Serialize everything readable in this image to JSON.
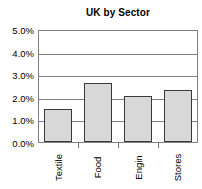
{
  "chart_data": {
    "type": "bar",
    "title": "UK by Sector",
    "xlabel": "",
    "ylabel": "",
    "categories": [
      "Textile",
      "Food",
      "Engin",
      "Stores"
    ],
    "values": [
      1.45,
      2.6,
      2.05,
      2.3
    ],
    "value_unit": "%",
    "ylim": [
      0,
      5
    ],
    "y_tick_values": [
      5.0,
      4.0,
      3.0,
      2.0,
      1.0,
      0.0
    ],
    "y_tick_labels": [
      "5.0%",
      "4.0%",
      "3.0%",
      "2.0%",
      "1.0%",
      "0.0%"
    ],
    "grid": true,
    "grid_axis": "y",
    "legend": false,
    "legend_position": "none",
    "bar_fill_color": "#d8d8d8",
    "bar_border_color": "#3a3a3a",
    "plot_border_color": "#808080",
    "gridline_color": "#808080",
    "text_color": "#000000",
    "background_color": "#ffffff",
    "x_tick_label_rotation": -90
  }
}
